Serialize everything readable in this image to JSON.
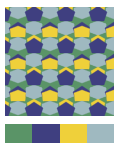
{
  "title": "Pattern",
  "pattern": {
    "type": "cairo-pentagonal-tiling",
    "colors": {
      "green": "#5a9467",
      "navy": "#3f3f80",
      "yellow": "#efd03a",
      "lightblue": "#9fb9c0"
    }
  },
  "palette": [
    {
      "name": "green",
      "hex": "#5a9467"
    },
    {
      "name": "navy",
      "hex": "#3f3f80"
    },
    {
      "name": "yellow",
      "hex": "#efd03a"
    },
    {
      "name": "lightblue",
      "hex": "#9fb9c0"
    }
  ]
}
